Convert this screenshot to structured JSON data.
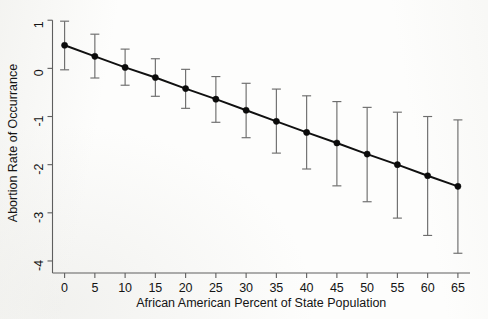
{
  "chart_data": {
    "type": "line",
    "title": "",
    "subtitle": "",
    "xlabel": "African American Percent of State Population",
    "ylabel": "Abortion Rate of Occurrance",
    "xlim": [
      -2,
      67
    ],
    "ylim": [
      -4.25,
      1.15
    ],
    "xticks": [
      0,
      5,
      10,
      15,
      20,
      25,
      30,
      35,
      40,
      45,
      50,
      55,
      60,
      65
    ],
    "xtick_labels": [
      "0",
      "5",
      "10",
      "15",
      "20",
      "25",
      "30",
      "35",
      "40",
      "45",
      "50",
      "55",
      "60",
      "65"
    ],
    "yticks": [
      1,
      0,
      -1,
      -2,
      -3,
      -4
    ],
    "ytick_labels": [
      "1",
      "0",
      "-1",
      "-2",
      "-3",
      "-4"
    ],
    "grid": false,
    "legend": null,
    "legend_position": "none",
    "annotations": [],
    "marker_style": "filled-circle",
    "error_bars": "capped-vertical-95ci",
    "line_color": "#101010",
    "marker_color": "#0b0b0b",
    "errorbar_color": "#6d6d6d",
    "axis_color": "#5e5e5e",
    "background_color": "#fdfdfc",
    "x": [
      0,
      5,
      10,
      15,
      20,
      25,
      30,
      35,
      40,
      45,
      50,
      55,
      60,
      65
    ],
    "series": [
      {
        "name": "Predicted abortion rate of occurrance",
        "values": [
          0.48,
          0.25,
          0.02,
          -0.19,
          -0.42,
          -0.64,
          -0.87,
          -1.1,
          -1.33,
          -1.55,
          -1.78,
          -2.0,
          -2.23,
          -2.45
        ],
        "ci_lower": [
          -0.03,
          -0.2,
          -0.35,
          -0.58,
          -0.83,
          -1.12,
          -1.44,
          -1.76,
          -2.09,
          -2.44,
          -2.77,
          -3.11,
          -3.47,
          -3.84
        ],
        "ci_upper": [
          0.98,
          0.71,
          0.4,
          0.2,
          -0.02,
          -0.17,
          -0.31,
          -0.43,
          -0.57,
          -0.69,
          -0.81,
          -0.91,
          -1.0,
          -1.07
        ]
      }
    ]
  }
}
